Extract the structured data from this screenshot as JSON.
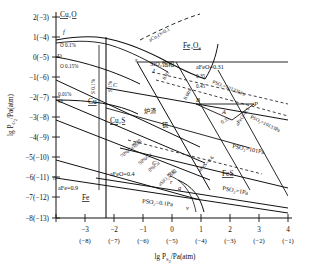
{
  "figure": {
    "kind": "predominance-area-diagram",
    "system": "Cu-Fe-S-O",
    "yaxis": {
      "label_main": "lg P",
      "label_sub": "O",
      "label_sub2": "2",
      "label_unit": "/Pa(atm)",
      "ticks": [
        "2(−3)",
        "1(−4)",
        "0(−5)",
        "−1(−6)",
        "−2(−7)",
        "−3(−8)",
        "−4(−9)",
        "−5(−10)",
        "−6(−11)",
        "−7(−12)",
        "−8(−13)"
      ],
      "values": [
        2,
        1,
        0,
        -1,
        -2,
        -3,
        -4,
        -5,
        -6,
        -7,
        -8
      ]
    },
    "xaxis": {
      "label_main": "lg P",
      "label_sub": "S",
      "label_sub2": "2",
      "label_unit": "/Pa(atm)",
      "ticks_top": [
        "−3",
        "−2",
        "−1",
        "0",
        "1",
        "2",
        "3",
        "4"
      ],
      "ticks_bottom": [
        "(−8)",
        "(−7)",
        "(−6)",
        "(−5)",
        "(−4)",
        "(−3)",
        "(−2)",
        "(−1)"
      ],
      "values": [
        -3,
        -2,
        -1,
        0,
        1,
        2,
        3,
        4
      ],
      "range": [
        -4,
        4
      ]
    },
    "phases": [
      {
        "name": "Cu2O-field",
        "label": "Cu₂O",
        "x": 60,
        "y": 17
      },
      {
        "name": "Cu-field",
        "label": "Cu",
        "x": 88,
        "y": 104
      },
      {
        "name": "Cu2S-field",
        "label": "Cu₂S",
        "x": 112,
        "y": 123
      },
      {
        "name": "Fe3O4-field",
        "label": "Fe₃O₄",
        "x": 183,
        "y": 48
      },
      {
        "name": "Fe-field",
        "label": "Fe",
        "x": 82,
        "y": 200
      },
      {
        "name": "FeS-field",
        "label": "FeS",
        "x": 222,
        "y": 176
      }
    ],
    "region_labels": [
      {
        "name": "slag",
        "text": "炉渣",
        "x": 144,
        "y": 113
      },
      {
        "name": "matte",
        "text": "锍",
        "x": 160,
        "y": 127
      },
      {
        "name": "sio2-saturation",
        "text": "SiO₂饱和",
        "x": 155,
        "y": 66
      }
    ],
    "activity_labels": [
      {
        "name": "a-Cu2O",
        "text": "aCu₂O=0.1"
      },
      {
        "name": "a-FeO-031",
        "text": "aFeO=0.31"
      },
      {
        "name": "a-FeO-035",
        "text": "0.35"
      },
      {
        "name": "a-FeO-045",
        "text": "0.45"
      },
      {
        "name": "a-FeO-001",
        "text": "0.01"
      },
      {
        "name": "a-FeO-0001",
        "text": "0.001"
      },
      {
        "name": "a-FeO-03",
        "text": "aFeO=0.3"
      },
      {
        "name": "a-FeO-035b",
        "text": "0.35"
      },
      {
        "name": "a-FeO-04",
        "text": "aFeO=0.4"
      },
      {
        "name": "a-Fe-09",
        "text": "aFe=0.9"
      },
      {
        "name": "a-FeS-06",
        "text": "aFeS=0.6"
      },
      {
        "name": "a-SiO2-sat",
        "text": "aSiO₂饱和"
      }
    ],
    "pso2_labels": [
      {
        "name": "pso2-101325",
        "text": "PSO₂=101325Pa"
      },
      {
        "name": "pso2-10133",
        "text": "PSO₂=10133Pa"
      },
      {
        "name": "pso2-101",
        "text": "PSO₂=101Pa"
      },
      {
        "name": "pso2-1",
        "text": "PSO₂=1Pa"
      },
      {
        "name": "pso2-01",
        "text": "PSO₂=0.1Pa"
      }
    ],
    "concentration_labels": [
      {
        "name": "o-01",
        "text": "O 0.1%"
      },
      {
        "name": "o-015",
        "text": "O 0.15%"
      },
      {
        "name": "o-001",
        "text": "0.01%"
      },
      {
        "name": "s-01",
        "text": "S 0.1%"
      },
      {
        "name": "s-1",
        "text": "S 1%"
      },
      {
        "name": "cu-70",
        "text": "70%Cu饱和"
      },
      {
        "name": "cu-50",
        "text": "50%Cu"
      },
      {
        "name": "cu-0",
        "text": "0%Cu"
      }
    ],
    "point_labels": [
      {
        "name": "pt-f",
        "text": "f",
        "x": 63,
        "y": 34
      },
      {
        "name": "pt-D",
        "text": "D",
        "x": 57,
        "y": 55
      },
      {
        "name": "pt-O",
        "text": "O",
        "x": 58,
        "y": 101
      },
      {
        "name": "pt-s",
        "text": "s",
        "x": 137,
        "y": 61
      },
      {
        "name": "pt-J",
        "text": "J",
        "x": 152,
        "y": 72
      },
      {
        "name": "pt-C1",
        "text": "C",
        "x": 113,
        "y": 86
      },
      {
        "name": "pt-B",
        "text": "B",
        "x": 196,
        "y": 100
      },
      {
        "name": "pt-A",
        "text": "A",
        "x": 222,
        "y": 112
      },
      {
        "name": "pt-P",
        "text": "P",
        "x": 254,
        "y": 105
      },
      {
        "name": "pt-C2",
        "text": "C",
        "x": 154,
        "y": 163
      },
      {
        "name": "pt-h",
        "text": "h",
        "x": 53,
        "y": 177
      },
      {
        "name": "pt-r",
        "text": "r",
        "x": 170,
        "y": 182
      },
      {
        "name": "pt-v",
        "text": "v",
        "x": 186,
        "y": 208
      },
      {
        "name": "pt-q",
        "text": "q",
        "x": 181,
        "y": 189
      }
    ]
  }
}
